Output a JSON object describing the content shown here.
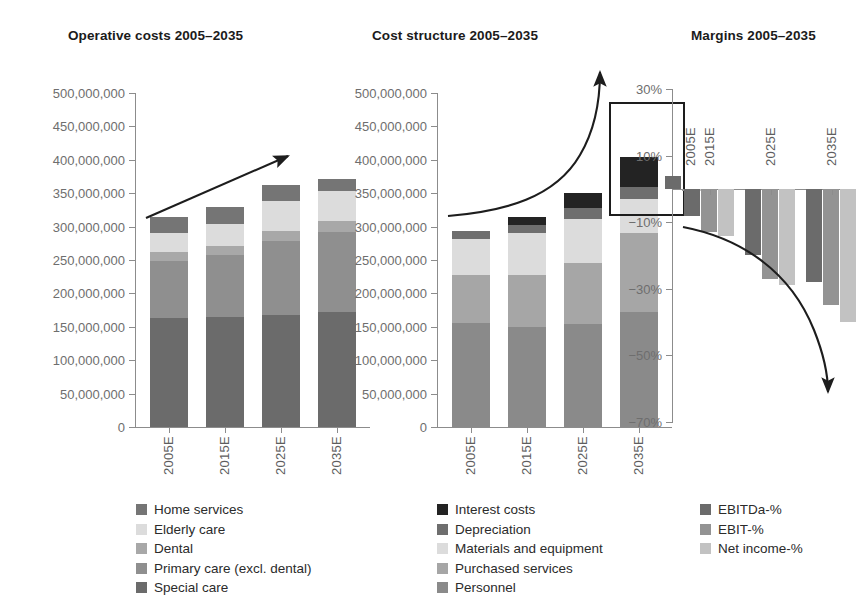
{
  "chart_data": [
    {
      "type": "bar",
      "id": "operative-costs",
      "title": "Operative costs 2005–2035",
      "stacked": true,
      "categories": [
        "2005E",
        "2015E",
        "2025E",
        "2035E"
      ],
      "xlabel": "",
      "ylabel": "",
      "ylim": [
        0,
        500000000
      ],
      "yticks": [
        0,
        50000000,
        100000000,
        150000000,
        200000000,
        250000000,
        300000000,
        350000000,
        400000000,
        450000000,
        500000000
      ],
      "ytick_labels": [
        "0",
        "50,000,000",
        "100,000,000",
        "150,000,000",
        "200,000,000",
        "250,000,000",
        "300,000,000",
        "350,000,000",
        "400,000,000",
        "450,000,000",
        "500,000,000"
      ],
      "grid": false,
      "legend_position": "bottom",
      "annotation": "upward trend arrow",
      "series": [
        {
          "name": "Special care",
          "color": "#6b6b6b",
          "values": [
            163000000,
            165000000,
            168000000,
            172000000
          ]
        },
        {
          "name": "Primary care (excl. dental)",
          "color": "#8f8f8f",
          "values": [
            86000000,
            92000000,
            110000000,
            120000000
          ]
        },
        {
          "name": "Dental",
          "color": "#a8a8a8",
          "values": [
            13000000,
            14000000,
            15000000,
            16000000
          ]
        },
        {
          "name": "Elderly care",
          "color": "#dcdcdc",
          "values": [
            28000000,
            33000000,
            45000000,
            45000000
          ]
        },
        {
          "name": "Home services",
          "color": "#757575",
          "values": [
            24000000,
            25000000,
            24000000,
            18000000
          ]
        }
      ],
      "totals": [
        314000000,
        329000000,
        362000000,
        371000000
      ]
    },
    {
      "type": "bar",
      "id": "cost-structure",
      "title": "Cost structure 2005–2035",
      "stacked": true,
      "categories": [
        "2005E",
        "2015E",
        "2025E",
        "2035E"
      ],
      "xlabel": "",
      "ylabel": "",
      "ylim": [
        0,
        500000000
      ],
      "yticks": [
        0,
        50000000,
        100000000,
        150000000,
        200000000,
        250000000,
        300000000,
        350000000,
        400000000,
        450000000,
        500000000
      ],
      "ytick_labels": [
        "0",
        "50,000,000",
        "100,000,000",
        "150,000,000",
        "200,000,000",
        "250,000,000",
        "300,000,000",
        "350,000,000",
        "400,000,000",
        "450,000,000",
        "500,000,000"
      ],
      "grid": false,
      "legend_position": "bottom",
      "annotation": "exponential growth arrow",
      "highlight": {
        "series": "Interest costs",
        "category": "2035E",
        "label": ""
      },
      "series": [
        {
          "name": "Personnel",
          "color": "#8a8a8a",
          "values": [
            156000000,
            150000000,
            154000000,
            172000000
          ]
        },
        {
          "name": "Purchased services",
          "color": "#a6a6a6",
          "values": [
            72000000,
            78000000,
            92000000,
            118000000
          ]
        },
        {
          "name": "Materials and equipment",
          "color": "#dcdcdc",
          "values": [
            54000000,
            62000000,
            66000000,
            52000000
          ]
        },
        {
          "name": "Depreciation",
          "color": "#6e6e6e",
          "values": [
            12000000,
            12000000,
            16000000,
            18000000
          ]
        },
        {
          "name": "Interest costs",
          "color": "#232323",
          "values": [
            0,
            12000000,
            22000000,
            44000000
          ]
        }
      ],
      "totals": [
        294000000,
        314000000,
        350000000,
        404000000
      ]
    },
    {
      "type": "bar",
      "id": "margins",
      "title": "Margins 2005–2035",
      "stacked": false,
      "categories": [
        "2005E",
        "2015E",
        "2025E",
        "2035E"
      ],
      "xlabel": "",
      "ylabel": "",
      "ylim": [
        -70,
        30
      ],
      "yticks": [
        30,
        10,
        -10,
        -30,
        -50,
        -70
      ],
      "ytick_labels": [
        "30%",
        "10%",
        "−10%",
        "−30%",
        "−50%",
        "−70%"
      ],
      "grid": false,
      "legend_position": "bottom",
      "annotation": "downward declining arrow",
      "series": [
        {
          "name": "EBITDa-%",
          "color": "#6b6b6b",
          "values": [
            4,
            -8,
            -20,
            -28
          ]
        },
        {
          "name": "EBIT-%",
          "color": "#939393",
          "values": [
            -0.5,
            -13,
            -27,
            -35
          ]
        },
        {
          "name": "Net income-%",
          "color": "#c2c2c2",
          "values": [
            -0.5,
            -14,
            -29,
            -40
          ]
        }
      ]
    }
  ],
  "legends": [
    {
      "id": "legend-operative-costs",
      "items": [
        {
          "label": "Home services",
          "color": "#757575"
        },
        {
          "label": "Elderly care",
          "color": "#dcdcdc"
        },
        {
          "label": "Dental",
          "color": "#a8a8a8"
        },
        {
          "label": "Primary care (excl. dental)",
          "color": "#8f8f8f"
        },
        {
          "label": "Special care",
          "color": "#6b6b6b"
        }
      ]
    },
    {
      "id": "legend-cost-structure",
      "items": [
        {
          "label": "Interest costs",
          "color": "#232323"
        },
        {
          "label": "Depreciation",
          "color": "#6e6e6e"
        },
        {
          "label": "Materials and equipment",
          "color": "#dcdcdc"
        },
        {
          "label": "Purchased services",
          "color": "#a6a6a6"
        },
        {
          "label": "Personnel",
          "color": "#8a8a8a"
        }
      ]
    },
    {
      "id": "legend-margins",
      "items": [
        {
          "label": "EBITDa-%",
          "color": "#6b6b6b"
        },
        {
          "label": "EBIT-%",
          "color": "#939393"
        },
        {
          "label": "Net income-%",
          "color": "#c2c2c2"
        }
      ]
    }
  ]
}
